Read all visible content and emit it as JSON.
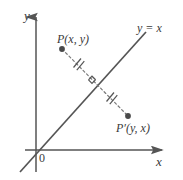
{
  "figure": {
    "background_color": "#ffffff",
    "stroke_color": "#555555",
    "label_color": "#3a3a3a",
    "axes": {
      "x_label": "x",
      "y_label": "y",
      "origin_label": "0"
    },
    "line": {
      "equation_label": "y = x",
      "slope": 1,
      "intercept": 0,
      "style": "solid"
    },
    "points": [
      {
        "name": "P",
        "label": "P(x, y)",
        "coordinate_text": "(x, y)",
        "position": "above-left of line"
      },
      {
        "name": "P'",
        "label": "P′(y, x)",
        "coordinate_text": "(y, x)",
        "position": "below-right of line"
      }
    ],
    "segment": {
      "style": "dashed",
      "tick_marks": 2,
      "tick_note": "congruent halves",
      "right_angle_marker": true
    }
  }
}
